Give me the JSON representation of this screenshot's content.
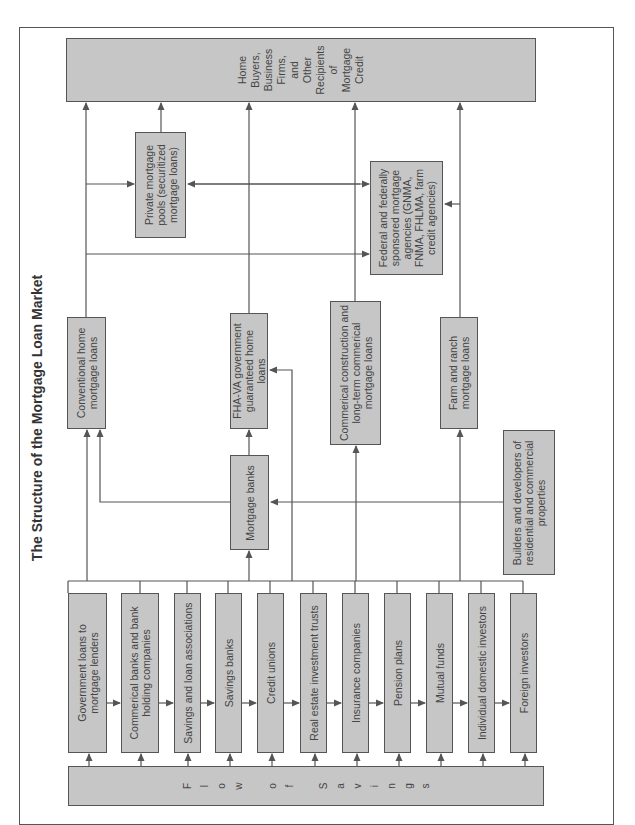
{
  "title": "The Structure of the Mortgage Loan Market",
  "recipients": {
    "lines": [
      "Home",
      "Buyers,",
      "Business",
      "Firms,",
      "and",
      "Other",
      "Recipients",
      "of",
      "Mortgage",
      "Credit"
    ]
  },
  "pools": {
    "private": "Private mortgage pools (securitized mortgage loans)",
    "federal": "Federal and federally sponsored mortgage agencies (GNMA, FNMA, FHLMA, farm credit agencies)"
  },
  "loan_types": {
    "conventional": "Conventional home mortgage loans",
    "fha_va": "FHA-VA government guaranteed home loans",
    "commercial": "Commerical construction and long-term commerical mortgage loans",
    "farm": "Farm and ranch mortgage loans"
  },
  "intermediaries": {
    "mortgage_banks": "Mortgage banks",
    "builders": "Builders and developers of residential and commercial properties"
  },
  "institutions": [
    "Government loans to mortgage lenders",
    "Commerical banks and bank holding companies",
    "Savings and loan associations",
    "Savings banks",
    "Credit unions",
    "Real estate investment trusts",
    "Insurance companies",
    "Pension plans",
    "Mutual funds",
    "Individual domestic investors",
    "Foreign investors"
  ],
  "flow": {
    "label": "Flow of Savings",
    "letters": [
      "F",
      "l",
      "o",
      "w",
      " ",
      "o",
      "f",
      " ",
      "S",
      "a",
      "v",
      "i",
      "n",
      "g",
      "s"
    ]
  },
  "colors": {
    "box_fill": "#c6c6c6",
    "line": "#555555",
    "text": "#444444"
  }
}
